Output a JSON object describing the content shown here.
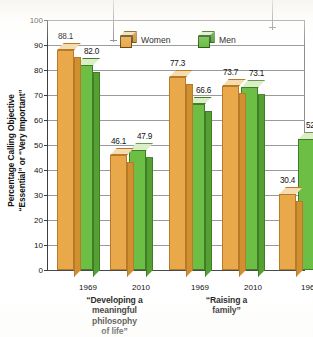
{
  "chart_data": {
    "type": "bar",
    "title": "",
    "xlabel": "",
    "ylabel": "Percentage Calling Objective \"Essential\" or \"Very Important\"",
    "ylabel_lines": [
      "Percentage Calling Objective",
      "“Essential” or “Very Important”"
    ],
    "ylim": [
      0,
      100
    ],
    "ytick_values": [
      0,
      10,
      20,
      30,
      40,
      50,
      60,
      70,
      80,
      90,
      100
    ],
    "ytick_labels": [
      "0",
      "10",
      "20",
      "30",
      "40",
      "50",
      "60",
      "70",
      "80",
      "90",
      "100"
    ],
    "grid": true,
    "legend_position": "top-center",
    "series": [
      {
        "name": "Women",
        "color": "#e9a94b",
        "values": [
          88.1,
          46.1,
          77.3,
          73.7,
          30.4,
          76.9
        ]
      },
      {
        "name": "Men",
        "color": "#6dbe45",
        "values": [
          82.0,
          47.9,
          66.6,
          73.1,
          52.3,
          77.9
        ]
      }
    ],
    "categories": [
      "1969",
      "2010",
      "1969",
      "2010",
      "1969",
      "2010"
    ],
    "groups": [
      {
        "label_lines": [
          "“Developing a",
          "meaningful",
          "philosophy",
          "of life”"
        ],
        "years": [
          "1969",
          "2010"
        ],
        "points": [
          {
            "year": "1969",
            "women": 88.1,
            "men": 82.0
          },
          {
            "year": "2010",
            "women": 46.1,
            "men": 47.9
          }
        ]
      },
      {
        "label_lines": [
          "“Raising a",
          "family”"
        ],
        "years": [
          "1969",
          "2010"
        ],
        "points": [
          {
            "year": "1969",
            "women": 77.3,
            "men": 66.6
          },
          {
            "year": "2010",
            "women": 73.7,
            "men": 73.1
          }
        ]
      },
      {
        "label_lines": [
          "“Being very well",
          "off financially”"
        ],
        "years": [
          "1969",
          "2010"
        ],
        "points": [
          {
            "year": "1969",
            "women": 30.4,
            "men": 52.3
          },
          {
            "year": "2010",
            "women": 76.9,
            "men": 77.9
          }
        ]
      }
    ],
    "value_labels": [
      "88.1",
      "82.0",
      "46.1",
      "47.9",
      "77.3",
      "66.6",
      "73.7",
      "73.1",
      "30.4",
      "52.3",
      "76.9",
      "77.9"
    ]
  },
  "legend": {
    "items": [
      {
        "label": "Women",
        "color": "#e9a94b"
      },
      {
        "label": "Men",
        "color": "#6dbe45"
      }
    ]
  }
}
